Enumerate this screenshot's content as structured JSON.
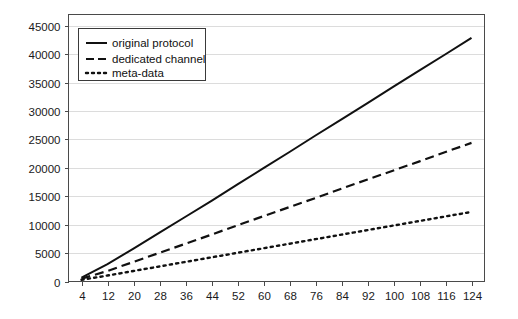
{
  "chart_data": {
    "type": "line",
    "title": "",
    "xlabel": "",
    "ylabel": "",
    "grid": true,
    "legend_position": "top-left",
    "xlim": [
      0,
      128
    ],
    "ylim": [
      0,
      47000
    ],
    "x_ticks": [
      4,
      12,
      20,
      28,
      36,
      44,
      52,
      60,
      68,
      76,
      84,
      92,
      100,
      108,
      116,
      124
    ],
    "y_ticks": [
      0,
      5000,
      10000,
      15000,
      20000,
      25000,
      30000,
      35000,
      40000,
      45000
    ],
    "x": [
      4,
      12,
      20,
      28,
      36,
      44,
      52,
      60,
      68,
      76,
      84,
      92,
      100,
      108,
      116,
      124
    ],
    "series": [
      {
        "name": "original protocol",
        "style": "solid",
        "values": [
          700,
          3050,
          5800,
          8600,
          11400,
          14200,
          17100,
          19950,
          22800,
          25700,
          28550,
          31400,
          34300,
          37150,
          40000,
          42900
        ]
      },
      {
        "name": "dedicated channel",
        "style": "dashed",
        "values": [
          500,
          1850,
          3450,
          5050,
          6650,
          8250,
          9900,
          11500,
          13100,
          14700,
          16350,
          17950,
          19550,
          21150,
          22800,
          24400
        ]
      },
      {
        "name": "meta-data",
        "style": "dotted",
        "values": [
          300,
          1050,
          1850,
          2650,
          3450,
          4250,
          5050,
          5850,
          6650,
          7450,
          8250,
          9050,
          9850,
          10650,
          11450,
          12250
        ]
      }
    ],
    "series_endpoints": {
      "original protocol": 46000,
      "dedicated channel": 26000,
      "meta-data": 12600
    }
  },
  "legend": {
    "entries": [
      {
        "label": "original protocol"
      },
      {
        "label": "dedicated channel"
      },
      {
        "label": "meta-data"
      }
    ]
  },
  "colors": {
    "background": "#ffffff",
    "line": "#111111",
    "grid": "#dcdcdc",
    "axis": "#4a4a4a"
  }
}
